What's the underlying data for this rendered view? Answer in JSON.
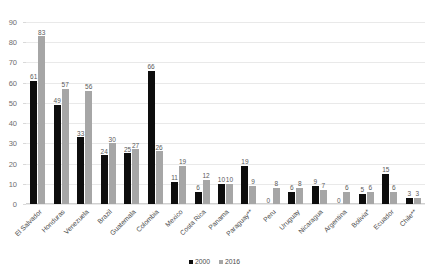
{
  "chart_data": {
    "type": "bar",
    "title": "",
    "xlabel": "",
    "ylabel": "",
    "ylim": [
      0,
      90
    ],
    "ytick_step": 10,
    "yticks": [
      90,
      80,
      70,
      60,
      50,
      40,
      30,
      20,
      10,
      0
    ],
    "grid": true,
    "legend_position": "bottom",
    "categories": [
      "El Salvador",
      "Honduras",
      "Venezuela",
      "Brazil",
      "Guatemala",
      "Colombia",
      "Mexico",
      "Costa Rica",
      "Panama",
      "Paraguay**",
      "Peru",
      "Uruguay",
      "Nicaragua",
      "Argentina",
      "Bolivia*",
      "Ecuador",
      "Chile**"
    ],
    "series": [
      {
        "name": "2000",
        "color": "#0d0d0d",
        "values": [
          61,
          49,
          33,
          24,
          25,
          66,
          11,
          6,
          10,
          19,
          0,
          6,
          9,
          0,
          5,
          15,
          3
        ]
      },
      {
        "name": "2016",
        "color": "#a6a6a6",
        "values": [
          83,
          57,
          56,
          30,
          27,
          26,
          19,
          12,
          10,
          9,
          8,
          8,
          7,
          6,
          6,
          6,
          3
        ]
      }
    ]
  },
  "legend": {
    "items": [
      {
        "label": "2000",
        "color": "#0d0d0d"
      },
      {
        "label": "2016",
        "color": "#a6a6a6"
      }
    ]
  }
}
